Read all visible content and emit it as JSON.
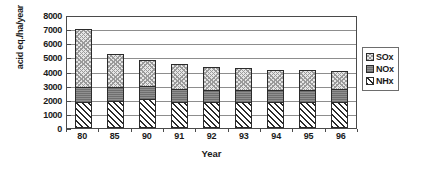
{
  "chart_data": {
    "type": "bar",
    "subtype": "stacked-bar",
    "title": "",
    "xlabel": "Year",
    "ylabel": "acid eq./ha/year",
    "categories": [
      "80",
      "85",
      "90",
      "91",
      "92",
      "93",
      "94",
      "95",
      "96"
    ],
    "ylim": [
      0,
      8000
    ],
    "ytick_step": 1000,
    "yticks": [
      "8000",
      "7000",
      "6000",
      "5000",
      "4000",
      "3000",
      "2000",
      "1000",
      "0"
    ],
    "grid": "horizontal",
    "legend_position": "right",
    "stack_order_bottom_to_top": [
      "NHx",
      "NOx",
      "SOx"
    ],
    "series": [
      {
        "name": "NHx",
        "pattern": "diagonal-hatch",
        "color": "#ffffff",
        "values": [
          1800,
          1850,
          2000,
          1800,
          1750,
          1750,
          1780,
          1780,
          1800
        ]
      },
      {
        "name": "NOx",
        "pattern": "solid-gray",
        "color": "#8a8a8a",
        "values": [
          1050,
          970,
          870,
          870,
          870,
          870,
          820,
          870,
          870
        ]
      },
      {
        "name": "SOx",
        "pattern": "crosshatch",
        "color": "#e6e6e6",
        "values": [
          4150,
          2430,
          1930,
          1880,
          1730,
          1630,
          1500,
          1450,
          1400
        ]
      }
    ],
    "totals": [
      7000,
      5250,
      4800,
      4550,
      4350,
      4250,
      4100,
      4100,
      4070
    ]
  },
  "legend": {
    "items": [
      {
        "label": "SOx",
        "swatch": "sox-swatch-icon"
      },
      {
        "label": "NOx",
        "swatch": "nox-swatch-icon"
      },
      {
        "label": "NHx",
        "swatch": "nhx-swatch-icon"
      }
    ]
  },
  "colors": {
    "axis": "#4a4a4a",
    "gridline": "#8d8d8d",
    "sox": "#e6e6e6",
    "nox": "#8a8a8a",
    "nhx": "#ffffff",
    "outline": "#2b2b2b",
    "text": "#1a1a1a",
    "background": "#ffffff"
  }
}
